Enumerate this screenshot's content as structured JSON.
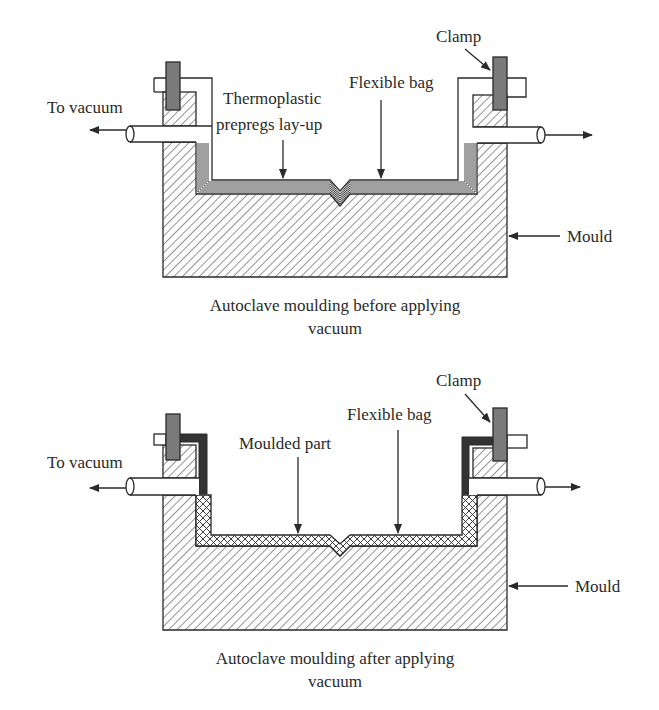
{
  "diagrams": [
    {
      "id": "before",
      "labels": {
        "clamp": "Clamp",
        "flexible_bag": "Flexible bag",
        "layup_line1": "Thermoplastic",
        "layup_line2": "prepregs lay-up",
        "to_vacuum": "To vacuum",
        "mould": "Mould"
      },
      "caption_line1": "Autoclave moulding before applying",
      "caption_line2": "vacuum"
    },
    {
      "id": "after",
      "labels": {
        "clamp": "Clamp",
        "flexible_bag": "Flexible bag",
        "moulded_part": "Moulded part",
        "to_vacuum": "To vacuum",
        "mould": "Mould"
      },
      "caption_line1": "Autoclave moulding after applying",
      "caption_line2": "vacuum"
    }
  ],
  "colors": {
    "ink": "#2a2a2a",
    "clamp_fill": "#7a7a7a",
    "bag_compressed": "#333333",
    "background": "#ffffff"
  }
}
